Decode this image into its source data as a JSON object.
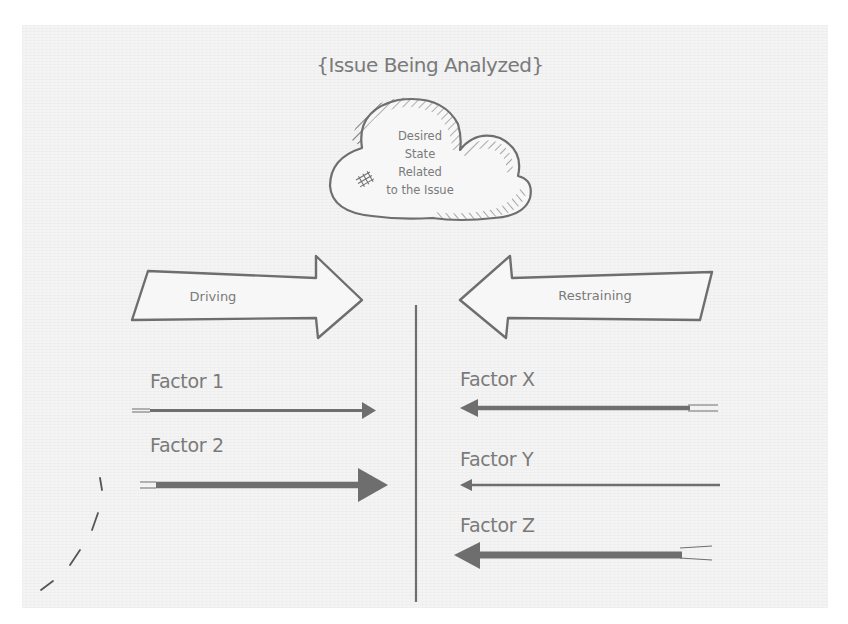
{
  "diagram": {
    "type": "force-field-analysis",
    "title": "{Issue Being Analyzed}",
    "desired_state": {
      "lines": [
        "Desired",
        "State",
        "Related",
        "to the Issue"
      ]
    },
    "driving": {
      "label": "Driving",
      "factors": [
        {
          "label": "Factor 1",
          "strength": "medium"
        },
        {
          "label": "Factor 2",
          "strength": "strong"
        }
      ]
    },
    "restraining": {
      "label": "Restraining",
      "factors": [
        {
          "label": "Factor X",
          "strength": "medium"
        },
        {
          "label": "Factor Y",
          "strength": "weak"
        },
        {
          "label": "Factor Z",
          "strength": "strong"
        }
      ]
    },
    "colors": {
      "background": "#f4f4f4",
      "stroke": "#6e6e6e",
      "text": "#7a7a7a"
    }
  }
}
